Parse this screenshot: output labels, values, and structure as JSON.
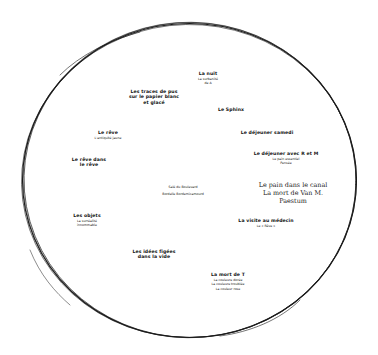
{
  "diagram": {
    "shape": "hand-drawn ellipse",
    "stroke_color": "#1a1a1a",
    "background": "#ffffff"
  },
  "labels": [
    {
      "id": "la-nuit",
      "title": "La nuit",
      "subtitles": [
        "La surbanité",
        "de A"
      ]
    },
    {
      "id": "traces-de-pus",
      "title_lines": [
        "Les traces de pus",
        "sur le papier blanc",
        "et glacé"
      ]
    },
    {
      "id": "sphinx",
      "title": "Le Sphinx"
    },
    {
      "id": "dejeuner-samedi",
      "title": "Le déjeuner samedi"
    },
    {
      "id": "le-reve",
      "title": "Le rêve",
      "subtitles": [
        "L'antiquité jaune"
      ]
    },
    {
      "id": "dejeuner-r-m",
      "title": "Le déjeuner avec R et M",
      "subtitles": [
        "Le pain essentiel",
        "Pensée"
      ]
    },
    {
      "id": "reve-dans-reve",
      "title_lines": [
        "Le rêve dans",
        "le rêve"
      ]
    },
    {
      "id": "center",
      "subtitles": [
        "Salé du Boulevard",
        "Bordelle Bordemicamourd"
      ]
    },
    {
      "id": "pain-canal",
      "serif_lines": [
        "Le pain dans le canal",
        "La mort de Van M.",
        "Paestum"
      ]
    },
    {
      "id": "les-objets",
      "title": "Les objets",
      "subtitles": [
        "La surréalité",
        "innommable"
      ]
    },
    {
      "id": "visite-medecin",
      "title": "La visite au médecin",
      "subtitles": [
        "Le « Rêve »"
      ]
    },
    {
      "id": "idees-figees",
      "title_lines": [
        "Les idées figées",
        "dans la vide"
      ]
    },
    {
      "id": "mort-de-t",
      "title": "La mort de T",
      "subtitles": [
        "La couleure dorée",
        "La couleure troublée",
        "La couleur rose"
      ]
    }
  ]
}
